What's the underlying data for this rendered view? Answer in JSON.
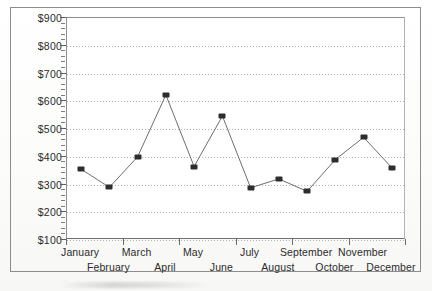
{
  "chart_data": {
    "type": "line",
    "title": "",
    "subtitle": "",
    "xlabel": "",
    "ylabel": "",
    "categories": [
      "January",
      "February",
      "March",
      "April",
      "May",
      "June",
      "July",
      "August",
      "September",
      "October",
      "November",
      "December"
    ],
    "values": [
      355,
      290,
      400,
      623,
      365,
      547,
      288,
      320,
      275,
      390,
      470,
      360
    ],
    "series": [
      {
        "name": "",
        "values": [
          355,
          290,
          400,
          623,
          365,
          547,
          288,
          320,
          275,
          390,
          470,
          360
        ]
      }
    ],
    "ylim": [
      100,
      900
    ],
    "ytick_values": [
      100,
      200,
      300,
      400,
      500,
      600,
      700,
      800,
      900
    ],
    "ytick_labels": [
      "$100",
      "$200",
      "$300",
      "$400",
      "$500",
      "$600",
      "$700",
      "$800",
      "$900"
    ],
    "y_minor_tick_step": 20,
    "grid": "horizontal-dotted",
    "legend": "none",
    "marker": "filled-square",
    "line_color": "#6e6e6e",
    "marker_color": "#2d2d2d",
    "grid_color": "#9a9a9a",
    "axis_color": "#6f6f6f",
    "xlabel_layout": "staggered-two-rows",
    "annotations": []
  }
}
